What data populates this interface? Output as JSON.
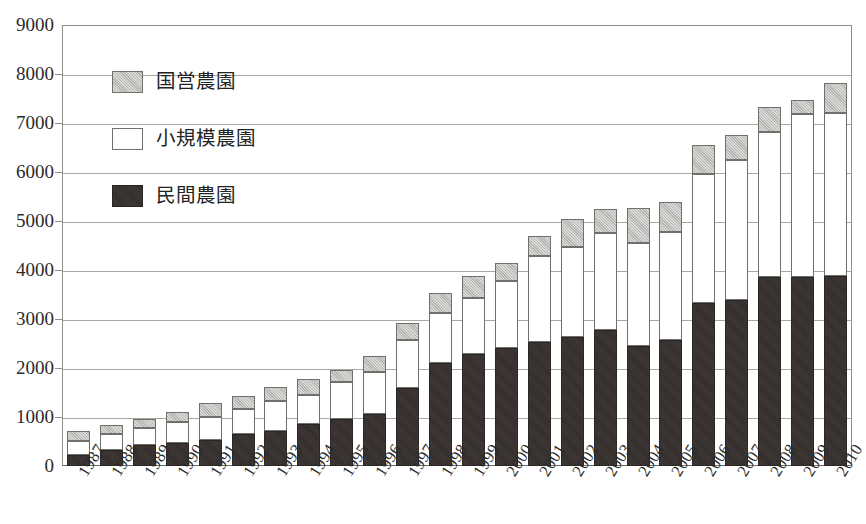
{
  "chart_data": {
    "type": "bar",
    "subtype": "stacked-bar",
    "title": "",
    "xlabel": "",
    "ylabel": "",
    "ylim": [
      0,
      9000
    ],
    "ytick_step": 1000,
    "yticks": [
      0,
      1000,
      2000,
      3000,
      4000,
      5000,
      6000,
      7000,
      8000,
      9000
    ],
    "ytick_labels": [
      "0",
      "1000",
      "2000",
      "3000",
      "4000",
      "5000",
      "6000",
      "7000",
      "8000",
      "9000"
    ],
    "grid": true,
    "grid_axis": "y",
    "legend_position": "upper-left-inside",
    "stack_order_bottom_to_top": [
      "民間農園",
      "小規模農園",
      "国営農園"
    ],
    "categories": [
      "1987",
      "1988",
      "1989",
      "1990",
      "1991",
      "1992",
      "1993",
      "1994",
      "1995",
      "1996",
      "1997",
      "1998",
      "1999",
      "2000",
      "2001",
      "2002",
      "2003",
      "2004",
      "2005",
      "2006",
      "2007",
      "2008",
      "2009",
      "2010"
    ],
    "series": [
      {
        "name": "民間農園",
        "color": "#332e2b",
        "values": [
          230,
          320,
          430,
          470,
          530,
          660,
          720,
          850,
          950,
          1070,
          1590,
          2100,
          2280,
          2400,
          2540,
          2630,
          2770,
          2450,
          2580,
          3330,
          3390,
          3850,
          3860,
          3880
        ]
      },
      {
        "name": "小規模農園",
        "color": "#ffffff",
        "values": [
          280,
          330,
          340,
          420,
          480,
          510,
          600,
          600,
          760,
          850,
          980,
          1020,
          1150,
          1380,
          1750,
          1840,
          1980,
          2100,
          2190,
          2630,
          2850,
          2970,
          3320,
          3330
        ]
      },
      {
        "name": "国営農園",
        "color": "#b9b9b5",
        "values": [
          200,
          190,
          190,
          210,
          270,
          250,
          290,
          320,
          250,
          330,
          340,
          410,
          450,
          370,
          410,
          570,
          500,
          710,
          620,
          600,
          510,
          500,
          300,
          600
        ]
      }
    ],
    "totals": [
      710,
      840,
      960,
      1100,
      1280,
      1420,
      1610,
      1770,
      1960,
      2250,
      2910,
      3530,
      3880,
      4150,
      4700,
      5040,
      5250,
      5260,
      5390,
      6560,
      6750,
      7320,
      7480,
      7810
    ]
  },
  "legend": {
    "items": [
      {
        "label": "国営農園",
        "swatch": "state-farm-swatch"
      },
      {
        "label": "小規模農園",
        "swatch": "small-farm-swatch"
      },
      {
        "label": "民間農園",
        "swatch": "private-farm-swatch"
      }
    ]
  },
  "colors": {
    "private": "#332e2b",
    "small": "#ffffff",
    "state": "#b9b9b5",
    "axis": "#8e8e8a",
    "grid": "#a9a9a4",
    "text": "#2b2b2b",
    "background": "#ffffff"
  }
}
